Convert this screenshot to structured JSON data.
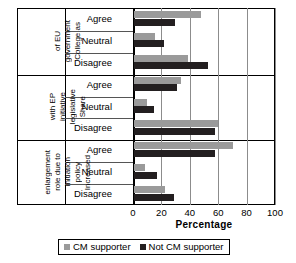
{
  "chart_data": {
    "type": "bar",
    "orientation": "horizontal",
    "title": "",
    "xlabel": "Percentage",
    "ylabel": "",
    "xlim": [
      0,
      100
    ],
    "xticks": [
      0,
      20,
      40,
      60,
      80,
      100
    ],
    "grid": true,
    "legend_position": "bottom",
    "categories": [
      "Agree",
      "Neutral",
      "Disagree"
    ],
    "groups": [
      {
        "label": "College as government of EU",
        "label_lines": [
          "College as",
          "government",
          "of EU"
        ],
        "rows": [
          {
            "category": "Agree",
            "CM supporter": 47,
            "Not CM supporter": 29
          },
          {
            "category": "Neutral",
            "CM supporter": 15,
            "Not CM supporter": 21
          },
          {
            "category": "Disagree",
            "CM supporter": 38,
            "Not CM supporter": 52
          }
        ]
      },
      {
        "label": "Share legislative initiative with EP",
        "label_lines": [
          "Share",
          "legislative",
          "initiative",
          "with EP"
        ],
        "rows": [
          {
            "category": "Agree",
            "CM supporter": 33,
            "Not CM supporter": 30
          },
          {
            "category": "Neutral",
            "CM supporter": 9,
            "Not CM supporter": 14
          },
          {
            "category": "Disagree",
            "CM supporter": 59,
            "Not CM supporter": 57
          }
        ]
      },
      {
        "label": "Increased policy initiation role due to enlargement",
        "label_lines": [
          "Increased",
          "policy",
          "initiation",
          "role due to",
          "enlargement"
        ],
        "rows": [
          {
            "category": "Agree",
            "CM supporter": 70,
            "Not CM supporter": 57
          },
          {
            "category": "Neutral",
            "CM supporter": 8,
            "Not CM supporter": 16
          },
          {
            "category": "Disagree",
            "CM supporter": 22,
            "Not CM supporter": 28
          }
        ]
      }
    ],
    "series": [
      {
        "name": "CM supporter",
        "color": "#9a9a9a"
      },
      {
        "name": "Not CM supporter",
        "color": "#231f20"
      }
    ]
  },
  "legend": {
    "items": [
      {
        "label": "CM supporter"
      },
      {
        "label": "Not CM supporter"
      }
    ]
  },
  "axis": {
    "x_title": "Percentage",
    "ticks": [
      "0",
      "20",
      "40",
      "60",
      "80",
      "100"
    ]
  }
}
